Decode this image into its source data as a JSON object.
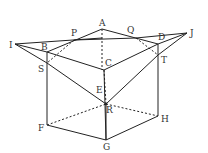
{
  "diagram": {
    "type": "geometry-cube-section",
    "labels": {
      "A": "A",
      "B": "B",
      "C": "C",
      "D": "D",
      "E": "E",
      "F": "F",
      "G": "G",
      "H": "H",
      "I": "I",
      "J": "J",
      "P": "P",
      "Q": "Q",
      "R": "R",
      "S": "S",
      "T": "T"
    },
    "stroke_color": "#222222"
  }
}
